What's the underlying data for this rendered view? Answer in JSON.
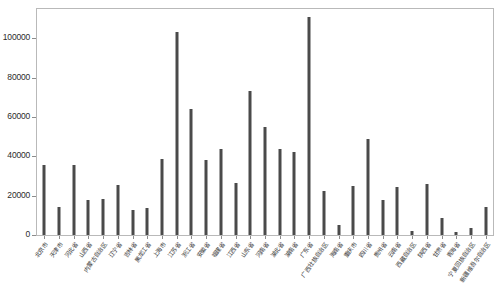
{
  "chart_data": {
    "type": "bar",
    "title": "",
    "subtitle": "",
    "xlabel": "",
    "ylabel": "",
    "ylim": [
      0,
      115000
    ],
    "grid": false,
    "legend": null,
    "legend_position": "none",
    "bar_color": "#4a4a4a",
    "frame_color": "#b9b9b9",
    "background_color": "#ffffff",
    "y_ticks": [
      0,
      20000,
      40000,
      60000,
      80000,
      100000
    ],
    "y_tick_labels": [
      "0",
      "20000",
      "40000",
      "60000",
      "80000",
      "100000"
    ],
    "categories": [
      "北京市",
      "天津市",
      "河北省",
      "山西省",
      "内蒙古自治区",
      "辽宁省",
      "吉林省",
      "黑龙江省",
      "上海市",
      "江苏省",
      "浙江省",
      "安徽省",
      "福建省",
      "江西省",
      "山东省",
      "河南省",
      "湖北省",
      "湖南省",
      "广东省",
      "广西壮族自治区",
      "海南省",
      "重庆市",
      "四川省",
      "贵州省",
      "云南省",
      "西藏自治区",
      "陕西省",
      "甘肃省",
      "青海省",
      "宁夏回族自治区",
      "新疆维吾尔自治区"
    ],
    "values": [
      35800,
      14300,
      35700,
      18000,
      18300,
      25200,
      12600,
      13700,
      38700,
      103500,
      64000,
      38000,
      43800,
      26500,
      73500,
      55200,
      43800,
      42000,
      111000,
      22600,
      5200,
      25000,
      48800,
      18000,
      24500,
      2200,
      25800,
      8500,
      1600,
      3400,
      14500
    ]
  }
}
